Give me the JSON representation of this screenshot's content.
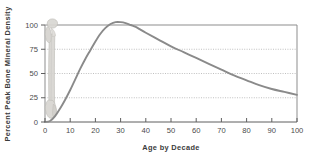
{
  "chart_data": {
    "type": "line",
    "title": "",
    "xlabel": "Age by Decade",
    "ylabel": "Percent  Peak Bone Mineral Density",
    "xlim": [
      0,
      100
    ],
    "ylim": [
      0,
      110
    ],
    "xticks": [
      0,
      10,
      20,
      30,
      40,
      50,
      60,
      70,
      80,
      90,
      100
    ],
    "xtick_labels": [
      "0",
      "10",
      "20",
      "30",
      "40",
      "50",
      "60",
      "70",
      "80",
      "90",
      "100"
    ],
    "yticks": [
      0,
      25,
      50,
      75,
      100
    ],
    "ytick_labels": [
      "0",
      "25",
      "50",
      "75",
      "100"
    ],
    "grid": "horizontal-dotted",
    "legend": "none",
    "series": [
      {
        "name": "Percent Peak Bone Mineral Density",
        "color": "#8a8a8a",
        "x": [
          0,
          2,
          4,
          6,
          8,
          10,
          12,
          14,
          16,
          18,
          20,
          22,
          24,
          26,
          28,
          30,
          32,
          34,
          36,
          38,
          40,
          45,
          50,
          55,
          60,
          65,
          70,
          75,
          80,
          85,
          90,
          95,
          100
        ],
        "values": [
          0,
          1,
          6,
          14,
          23,
          33,
          44,
          55,
          65,
          74,
          83,
          91,
          97,
          101,
          103,
          103,
          102,
          100,
          98,
          95,
          92,
          85,
          78,
          72,
          66,
          60,
          54,
          48,
          43,
          38,
          34,
          31,
          28
        ]
      }
    ],
    "annotations": [
      {
        "name": "femur-bone-illustration",
        "label": "femur bone graphic",
        "x": 0,
        "y_range": [
          0,
          104
        ],
        "color": "#d3d1cd"
      }
    ]
  },
  "axes": {
    "y_axis_title": "Percent  Peak Bone Mineral Density",
    "x_axis_title": "Age by Decade"
  },
  "colors": {
    "curve": "#8a8a8a",
    "grid": "#b3b3b3",
    "frame": "#8d8d8d",
    "bone_fill": "#d5d3cf",
    "bone_stroke": "#b9b7b2",
    "text": "#444444",
    "background": "#ffffff"
  }
}
